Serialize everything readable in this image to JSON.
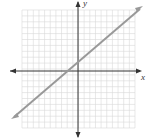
{
  "chart_data": {
    "type": "line",
    "title": "",
    "xlabel": "x",
    "ylabel": "y",
    "grid": true,
    "xlim": [
      -10,
      10
    ],
    "ylim": [
      -10,
      10
    ],
    "series": [
      {
        "name": "line",
        "x": [
          -10,
          10
        ],
        "y": [
          -8.5,
          11.5
        ],
        "slope": 1,
        "intercept": 1.5
      }
    ]
  },
  "labels": {
    "x": "x",
    "y": "y"
  }
}
